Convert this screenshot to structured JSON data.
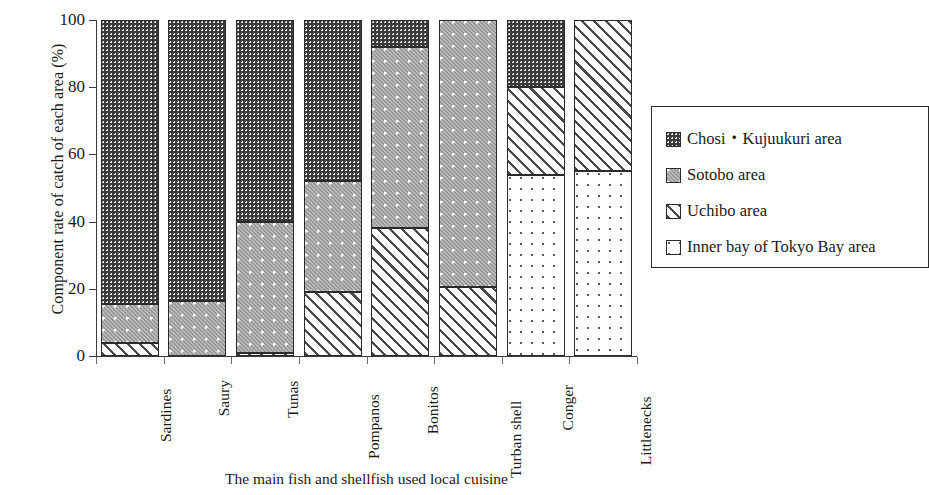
{
  "chart_data": {
    "type": "bar",
    "subtype": "stacked-100-percent",
    "title": "",
    "xlabel": "The main fish and shellfish used local cuisine",
    "ylabel": "Component rate of catch of each area  (%)",
    "ylim": [
      0,
      100
    ],
    "yticks": [
      0,
      20,
      40,
      60,
      80,
      100
    ],
    "grid": false,
    "legend_position": "right",
    "categories": [
      "Sardines",
      "Saury",
      "Tunas",
      "Pompanos",
      "Bonitos",
      "Turban shell",
      "Conger",
      "Littlenecks"
    ],
    "series": [
      {
        "name": "Chosi・Kujuukuri area",
        "pattern": "dark-checker",
        "values": [
          84.5,
          83.5,
          60.0,
          48.0,
          8.0,
          0.0,
          20.0,
          0.0
        ]
      },
      {
        "name": "Sotobo area",
        "pattern": "grey-dots",
        "values": [
          11.5,
          16.5,
          39.0,
          33.0,
          54.0,
          79.5,
          0.0,
          0.0
        ]
      },
      {
        "name": "Uchibo area",
        "pattern": "diagonal-hatch",
        "values": [
          4.0,
          0.0,
          1.0,
          19.0,
          38.0,
          20.5,
          26.0,
          45.0
        ]
      },
      {
        "name": "Inner bay of Tokyo Bay area",
        "pattern": "sparse-dots",
        "values": [
          0.0,
          0.0,
          0.0,
          0.0,
          0.0,
          0.0,
          54.0,
          55.0
        ]
      }
    ],
    "stack_order_bottom_to_top": [
      "Inner bay of Tokyo Bay area",
      "Uchibo area",
      "Sotobo area",
      "Chosi・Kujuukuri area"
    ],
    "colors": {
      "chosi": "#3a3a3a",
      "sotobo": "#9a9a9a",
      "uchibo": "#ffffff",
      "inner_bay": "#ffffff",
      "outline": "#2b2b2b",
      "axis": "#3a3a3a",
      "text": "#1a1a1a"
    }
  },
  "axis": {
    "y_title": "Component rate of catch of each area  (%)",
    "x_title": "The main fish and shellfish used local cuisine",
    "y_tick_labels": [
      "100",
      "80",
      "60",
      "40",
      "20",
      "0"
    ]
  },
  "legend": {
    "items": [
      {
        "label": "Chosi・Kujuukuri area",
        "pattern": "dark-checker"
      },
      {
        "label": "Sotobo area",
        "pattern": "grey-dots"
      },
      {
        "label": "Uchibo area",
        "pattern": "diagonal-hatch"
      },
      {
        "label": "Inner bay of Tokyo Bay area",
        "pattern": "sparse-dots"
      }
    ]
  }
}
